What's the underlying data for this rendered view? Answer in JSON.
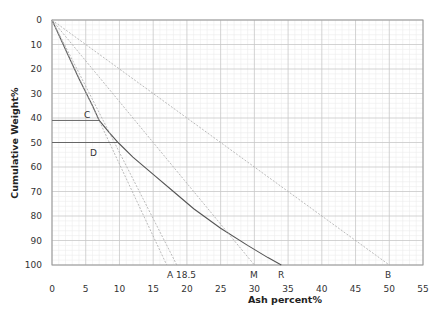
{
  "chart_data": {
    "type": "line",
    "title": "",
    "xlabel": "Ash percent%",
    "ylabel": "Cumulative Weight%",
    "xlim": [
      0,
      55
    ],
    "ylim": [
      0,
      100
    ],
    "y_inverted": true,
    "grid": true,
    "x_ticks": [
      0,
      5,
      10,
      15,
      20,
      25,
      30,
      35,
      40,
      45,
      50,
      55
    ],
    "y_ticks": [
      0,
      10,
      20,
      30,
      40,
      50,
      60,
      70,
      80,
      90,
      100
    ],
    "series": [
      {
        "name": "cumulative ash curve",
        "style": "solid",
        "x": [
          0,
          2,
          4,
          6,
          7,
          8.5,
          9.8,
          12,
          15,
          18,
          21,
          25,
          29,
          32,
          34
        ],
        "y": [
          0,
          12,
          24,
          35,
          41,
          46,
          50,
          56,
          63,
          70,
          77,
          85,
          92,
          97,
          100
        ]
      },
      {
        "name": "line A1",
        "style": "dashed",
        "x": [
          0,
          17
        ],
        "y": [
          0,
          100
        ]
      },
      {
        "name": "line A 18.5",
        "style": "dashed",
        "x": [
          0,
          18.5
        ],
        "y": [
          0,
          100
        ]
      },
      {
        "name": "line M",
        "style": "dashed",
        "x": [
          0,
          30
        ],
        "y": [
          0,
          100
        ]
      },
      {
        "name": "line B",
        "style": "dashed",
        "x": [
          0,
          50
        ],
        "y": [
          0,
          100
        ]
      }
    ],
    "annotations": [
      {
        "label": "C",
        "type": "hline",
        "y": 41,
        "x_end": 7.0
      },
      {
        "label": "D",
        "type": "hline",
        "y": 50,
        "x_end": 9.8
      },
      {
        "label": "A 18.5",
        "x": 18.5,
        "position": "below-axis"
      },
      {
        "label": "M",
        "x": 30,
        "position": "below-axis"
      },
      {
        "label": "R",
        "x": 34,
        "position": "below-axis"
      },
      {
        "label": "B",
        "x": 50,
        "position": "below-axis"
      }
    ]
  },
  "labels": {
    "xlabel": "Ash percent%",
    "ylabel": "Cumulative Weight%",
    "C": "C",
    "D": "D",
    "A": "A 18.5",
    "M": "M",
    "R": "R",
    "B": "B"
  }
}
